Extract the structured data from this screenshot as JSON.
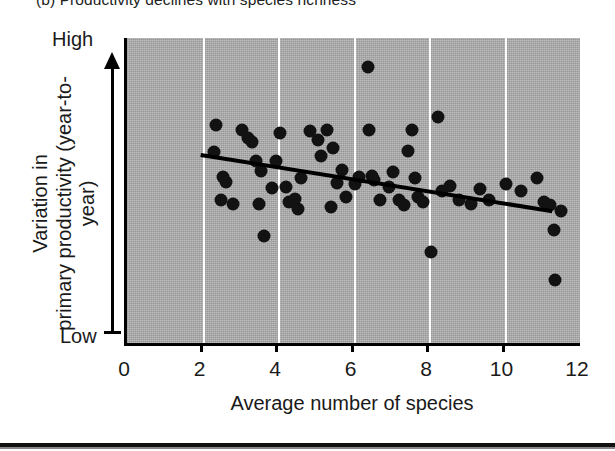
{
  "figure": {
    "caption_fragment": "(b)  Productivity declines with species richness",
    "y_axis": {
      "title_line1": "Variation in",
      "title_line2": "primary productivity",
      "title_line3": "(year-to-year)",
      "high_label": "High",
      "low_label": "Low"
    },
    "x_axis": {
      "title": "Average number of species",
      "ticks": [
        "0",
        "2",
        "4",
        "6",
        "8",
        "10",
        "12"
      ]
    },
    "colors": {
      "plot_background": "#a8a8a8",
      "gridline": "#ffffff",
      "point": "#121212",
      "trend_line": "#000000",
      "axis": "#000000"
    }
  },
  "chart_data": {
    "type": "scatter",
    "title": "",
    "xlabel": "Average number of species",
    "ylabel": "Variation in primary productivity (year-to-year)",
    "xlim": [
      0,
      12
    ],
    "ylim": [
      0,
      1
    ],
    "xticks": [
      0,
      2,
      4,
      6,
      8,
      10,
      12
    ],
    "yticks": [],
    "ytick_labels": [
      "Low",
      "High"
    ],
    "grid": "vertical-only",
    "legend": "none",
    "gridlines_x": [
      2,
      4,
      6,
      8,
      10
    ],
    "series": [
      {
        "name": "Study plots",
        "marker": "filled-circle",
        "points": [
          [
            2.35,
            0.715
          ],
          [
            2.3,
            0.625
          ],
          [
            2.55,
            0.545
          ],
          [
            2.62,
            0.528
          ],
          [
            2.48,
            0.468
          ],
          [
            2.8,
            0.455
          ],
          [
            3.05,
            0.7
          ],
          [
            3.2,
            0.672
          ],
          [
            3.3,
            0.66
          ],
          [
            3.42,
            0.598
          ],
          [
            3.55,
            0.565
          ],
          [
            3.5,
            0.455
          ],
          [
            3.62,
            0.352
          ],
          [
            3.85,
            0.508
          ],
          [
            3.95,
            0.596
          ],
          [
            4.05,
            0.69
          ],
          [
            4.2,
            0.512
          ],
          [
            4.3,
            0.462
          ],
          [
            4.45,
            0.472
          ],
          [
            4.52,
            0.438
          ],
          [
            4.6,
            0.54
          ],
          [
            4.85,
            0.695
          ],
          [
            5.05,
            0.665
          ],
          [
            5.15,
            0.612
          ],
          [
            5.3,
            0.7
          ],
          [
            5.45,
            0.64
          ],
          [
            5.4,
            0.447
          ],
          [
            5.55,
            0.525
          ],
          [
            5.7,
            0.568
          ],
          [
            5.8,
            0.48
          ],
          [
            6.05,
            0.52
          ],
          [
            6.15,
            0.545
          ],
          [
            6.38,
            0.905
          ],
          [
            6.42,
            0.7
          ],
          [
            6.5,
            0.548
          ],
          [
            6.55,
            0.536
          ],
          [
            6.7,
            0.47
          ],
          [
            6.95,
            0.512
          ],
          [
            7.05,
            0.56
          ],
          [
            7.2,
            0.47
          ],
          [
            7.35,
            0.452
          ],
          [
            7.45,
            0.628
          ],
          [
            7.55,
            0.7
          ],
          [
            7.62,
            0.54
          ],
          [
            7.7,
            0.478
          ],
          [
            7.85,
            0.462
          ],
          [
            8.05,
            0.3
          ],
          [
            8.25,
            0.742
          ],
          [
            8.35,
            0.5
          ],
          [
            8.55,
            0.515
          ],
          [
            8.8,
            0.468
          ],
          [
            9.1,
            0.455
          ],
          [
            9.35,
            0.505
          ],
          [
            9.6,
            0.47
          ],
          [
            10.05,
            0.52
          ],
          [
            10.45,
            0.5
          ],
          [
            10.85,
            0.54
          ],
          [
            11.05,
            0.462
          ],
          [
            11.2,
            0.452
          ],
          [
            11.3,
            0.37
          ],
          [
            11.35,
            0.205
          ],
          [
            11.5,
            0.432
          ]
        ]
      }
    ],
    "trend_line": {
      "name": "Fitted regression (negative slope)",
      "x_start": 1.95,
      "y_start": 0.622,
      "x_end": 11.25,
      "y_end": 0.438,
      "style": "solid",
      "width_px": 4
    }
  }
}
